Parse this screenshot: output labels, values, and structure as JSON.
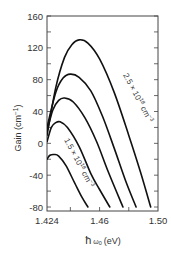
{
  "chart_data": {
    "type": "line",
    "title": "",
    "xlabel": "ħω₀ (eV)",
    "ylabel": "Gain (cm⁻¹)",
    "xlim": [
      1.424,
      1.5
    ],
    "ylim": [
      -85,
      160
    ],
    "x_ticks": [
      "1.424",
      "1.46",
      "1.50"
    ],
    "x_tick_values": [
      1.424,
      1.46,
      1.5
    ],
    "y_ticks": [
      "160",
      "120",
      "80",
      "40",
      "0",
      "-40",
      "-80"
    ],
    "y_tick_values": [
      160,
      120,
      80,
      40,
      0,
      -40,
      -80
    ],
    "grid": false,
    "legend": "none",
    "annotations": [
      {
        "text": "2.5 × 10¹⁸ cm⁻³",
        "attached_to": "series 1 (top curve)"
      },
      {
        "text": "1.5 × 10¹⁸ cm⁻³",
        "attached_to": "series 5 (bottom curve)"
      }
    ],
    "series": [
      {
        "name": "2.5 × 10¹⁸ cm⁻³",
        "x": [
          1.424,
          1.43,
          1.436,
          1.441,
          1.446,
          1.452,
          1.46,
          1.47,
          1.48,
          1.488,
          1.495
        ],
        "y": [
          10,
          70,
          108,
          124,
          130,
          126,
          106,
          64,
          10,
          -36,
          -80
        ]
      },
      {
        "name": "curve 2",
        "x": [
          1.424,
          1.43,
          1.435,
          1.44,
          1.446,
          1.454,
          1.462,
          1.47,
          1.478,
          1.485
        ],
        "y": [
          20,
          64,
          82,
          87,
          83,
          66,
          34,
          -6,
          -48,
          -80
        ]
      },
      {
        "name": "curve 3",
        "x": [
          1.424,
          1.428,
          1.432,
          1.436,
          1.442,
          1.45,
          1.458,
          1.466,
          1.476
        ],
        "y": [
          15,
          42,
          54,
          57,
          52,
          32,
          2,
          -36,
          -80
        ]
      },
      {
        "name": "curve 4",
        "x": [
          1.424,
          1.427,
          1.43,
          1.433,
          1.438,
          1.446,
          1.454,
          1.46,
          1.467
        ],
        "y": [
          2,
          20,
          26,
          27,
          20,
          -4,
          -38,
          -58,
          -80
        ]
      },
      {
        "name": "1.5 × 10¹⁸ cm⁻³",
        "x": [
          1.424,
          1.426,
          1.429,
          1.432,
          1.437,
          1.443,
          1.448,
          1.452
        ],
        "y": [
          -20,
          -15,
          -14,
          -16,
          -28,
          -50,
          -68,
          -80
        ]
      }
    ]
  },
  "axes": {
    "ylabel": "Gain (cm",
    "ylabel_sup": "−1",
    "ylabel_close": ")",
    "xlabel_hbar": "ħ",
    "xlabel_omega": "ω",
    "xlabel_sub": "0",
    "xlabel_unit": "(eV)"
  },
  "annotations": {
    "top_label": "2.5 × 10",
    "top_exp": "18",
    "top_unit": " cm",
    "top_unit_exp": "−3",
    "bottom_label": "1.5 × 10",
    "bottom_exp": "18",
    "bottom_unit": " cm",
    "bottom_unit_exp": "−3"
  }
}
